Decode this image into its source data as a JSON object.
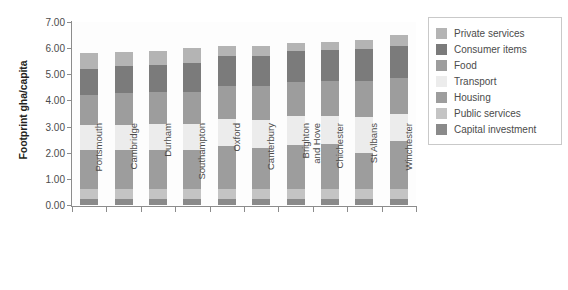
{
  "chart_data": {
    "type": "bar",
    "stacked": true,
    "title": "",
    "xlabel": "",
    "ylabel": "Footprint gha/capita",
    "ylim": [
      0.0,
      7.0
    ],
    "ytick_labels": [
      "0.00",
      "1.00",
      "2.00",
      "3.00",
      "4.00",
      "5.00",
      "6.00",
      "7.00"
    ],
    "ytick_values": [
      0,
      1,
      2,
      3,
      4,
      5,
      6,
      7
    ],
    "grid": false,
    "legend_position": "right",
    "categories": [
      "Portsmouth",
      "Cambridge",
      "Durham",
      "Southampton",
      "Oxford",
      "Canterbury",
      "Brighton\nand Hove",
      "Chichester",
      "St Albans",
      "Winchester"
    ],
    "series": [
      {
        "name": "Capital investment",
        "color": "#8a8a8a",
        "values": [
          0.22,
          0.22,
          0.22,
          0.22,
          0.22,
          0.22,
          0.22,
          0.22,
          0.22,
          0.22
        ]
      },
      {
        "name": "Public services",
        "color": "#c4c4c4",
        "values": [
          0.4,
          0.4,
          0.4,
          0.4,
          0.4,
          0.4,
          0.4,
          0.4,
          0.4,
          0.4
        ]
      },
      {
        "name": "Housing",
        "color": "#9d9d9d",
        "values": [
          1.48,
          1.48,
          1.48,
          1.48,
          1.63,
          1.58,
          1.68,
          1.73,
          1.38,
          1.83
        ]
      },
      {
        "name": "Transport",
        "color": "#ececec",
        "values": [
          0.95,
          0.95,
          1.0,
          1.0,
          1.05,
          1.07,
          1.1,
          1.05,
          1.35,
          1.05
        ]
      },
      {
        "name": "Food",
        "color": "#9d9d9d",
        "values": [
          1.15,
          1.22,
          1.22,
          1.22,
          1.25,
          1.28,
          1.3,
          1.33,
          1.4,
          1.35
        ]
      },
      {
        "name": "Consumer items",
        "color": "#7b7b7b",
        "values": [
          1.0,
          1.05,
          1.05,
          1.1,
          1.15,
          1.15,
          1.18,
          1.2,
          1.2,
          1.25
        ]
      },
      {
        "name": "Private services",
        "color": "#b4b4b4",
        "values": [
          0.6,
          0.53,
          0.53,
          0.58,
          0.4,
          0.4,
          0.32,
          0.32,
          0.35,
          0.4
        ]
      }
    ],
    "totals": [
      5.8,
      5.85,
      5.9,
      6.0,
      6.1,
      6.1,
      6.2,
      6.25,
      6.3,
      6.5
    ]
  },
  "legend": {
    "items": [
      {
        "label": "Private services",
        "color": "#b4b4b4"
      },
      {
        "label": "Consumer items",
        "color": "#7b7b7b"
      },
      {
        "label": "Food",
        "color": "#9d9d9d"
      },
      {
        "label": "Transport",
        "color": "#ececec"
      },
      {
        "label": "Housing",
        "color": "#9d9d9d"
      },
      {
        "label": "Public services",
        "color": "#c4c4c4"
      },
      {
        "label": "Capital investment",
        "color": "#8a8a8a"
      }
    ]
  }
}
